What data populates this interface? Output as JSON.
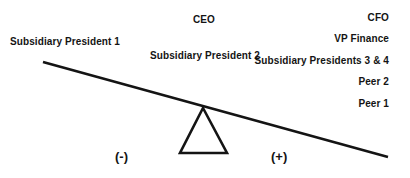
{
  "diagram": {
    "type": "lever-balance",
    "background_color": "#ffffff",
    "ink_color": "#141414",
    "beam": {
      "name": "lever-beam",
      "x1": 43,
      "y1": 62,
      "x2": 388,
      "y2": 157,
      "stroke_width": 2.6,
      "tilt": "down-to-the-right"
    },
    "fulcrum": {
      "name": "fulcrum-triangle",
      "apex_x": 203,
      "apex_y": 108,
      "base_left_x": 180,
      "base_right_x": 227,
      "base_y": 153,
      "stroke_width": 2.6,
      "fill": "none"
    },
    "signs": {
      "negative": "(-)",
      "positive": "(+)"
    },
    "left_side": {
      "polarity": "(-)",
      "items": [
        {
          "label": "Subsidiary President 1"
        }
      ]
    },
    "center": {
      "items": [
        {
          "label": "CEO"
        },
        {
          "label": "Subsidiary President 2"
        }
      ]
    },
    "right_side": {
      "polarity": "(+)",
      "items": [
        {
          "label": "CFO"
        },
        {
          "label": "VP Finance"
        },
        {
          "label": "Subsidiary Presidents 3 & 4"
        },
        {
          "label": "Peer 2"
        },
        {
          "label": "Peer 1"
        }
      ]
    }
  }
}
